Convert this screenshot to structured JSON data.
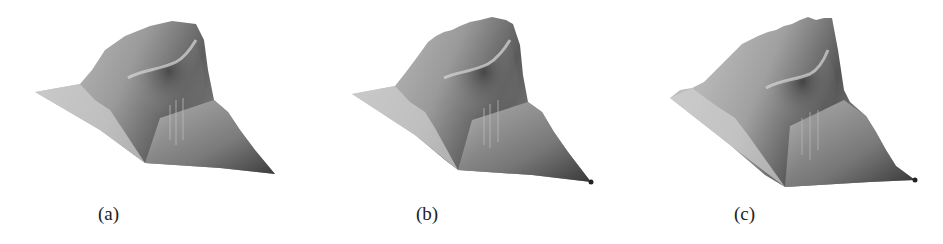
{
  "figure": {
    "panels": [
      {
        "label": "(a)",
        "surface": "smooth-surface-plot"
      },
      {
        "label": "(b)",
        "surface": "slightly-noisy-surface-plot"
      },
      {
        "label": "(c)",
        "surface": "noisy-surface-plot"
      }
    ]
  }
}
